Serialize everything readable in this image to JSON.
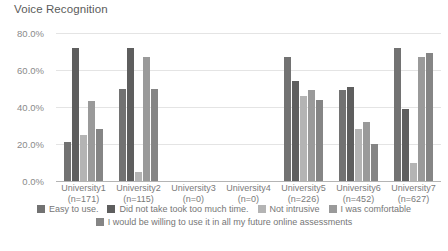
{
  "chart_data": {
    "type": "bar",
    "title": "Voice Recognition",
    "xlabel": "",
    "ylabel": "",
    "ylim": [
      0,
      80
    ],
    "grid": true,
    "legend_position": "bottom",
    "ytick_labels": [
      "80.0%",
      "60.0%",
      "40.0%",
      "20.0%",
      "0.0%"
    ],
    "ytick_values": [
      80,
      60,
      40,
      20,
      0
    ],
    "categories": [
      "University1\n(n=171)",
      "University2\n(n=115)",
      "University3\n(n=0)",
      "University4\n(n=0)",
      "University5\n(n=226)",
      "University6\n(n=452)",
      "University7\n(n=627)"
    ],
    "category_names": [
      "University1",
      "University2",
      "University3",
      "University4",
      "University5",
      "University6",
      "University7"
    ],
    "category_counts": [
      "(n=171)",
      "(n=115)",
      "(n=0)",
      "(n=0)",
      "(n=226)",
      "(n=452)",
      "(n=627)"
    ],
    "series": [
      {
        "name": "Easy to use.",
        "color": "#727272",
        "values": [
          21,
          50,
          0,
          0,
          67,
          49,
          72
        ]
      },
      {
        "name": "Did not take took too much time.",
        "color": "#5e5e5e",
        "values": [
          72,
          72,
          0,
          0,
          54,
          51,
          39
        ]
      },
      {
        "name": "Not intrusive",
        "color": "#b4b4b4",
        "values": [
          25,
          5,
          0,
          0,
          46,
          28,
          10
        ]
      },
      {
        "name": "I was comfortable",
        "color": "#9a9a9a",
        "values": [
          43,
          67,
          0,
          0,
          49,
          32,
          67
        ]
      },
      {
        "name": "I would be willing to use it in all my future online assessments",
        "color": "#858585",
        "values": [
          28,
          50,
          0,
          0,
          44,
          20,
          69
        ]
      }
    ]
  },
  "legend_rows": [
    [
      0,
      1,
      2,
      3
    ],
    [
      4
    ]
  ]
}
